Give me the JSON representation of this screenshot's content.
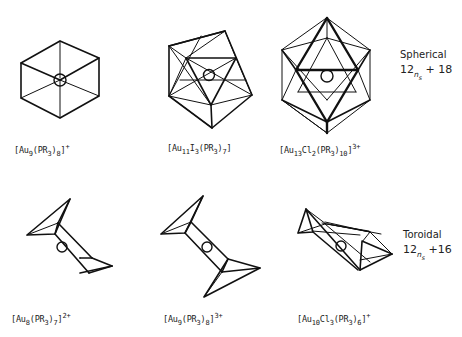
{
  "figure": {
    "rows": [
      {
        "class": "Spherical",
        "electron_rule": {
          "base": "12",
          "var": "n",
          "var_sub": "s",
          "offset": "+ 18"
        },
        "clusters": [
          {
            "id": "au9-spherical",
            "metal": "Au",
            "metal_count": "9",
            "halide": "",
            "halide_count": "",
            "ligand": "(PR",
            "ligand_sub": "3",
            "ligand_count": "8",
            "charge": "+"
          },
          {
            "id": "au11",
            "metal": "Au",
            "metal_count": "11",
            "halide": "I",
            "halide_count": "3",
            "ligand": "(PR",
            "ligand_sub": "3",
            "ligand_count": "7",
            "charge": ""
          },
          {
            "id": "au13",
            "metal": "Au",
            "metal_count": "13",
            "halide": "Cl",
            "halide_count": "2",
            "ligand": "(PR",
            "ligand_sub": "3",
            "ligand_count": "10",
            "charge": "3+"
          }
        ]
      },
      {
        "class": "Toroidal",
        "electron_rule": {
          "base": "12",
          "var": "n",
          "var_sub": "s",
          "offset": "+16"
        },
        "clusters": [
          {
            "id": "au8",
            "metal": "Au",
            "metal_count": "8",
            "halide": "",
            "halide_count": "",
            "ligand": "(PR",
            "ligand_sub": "3",
            "ligand_count": "7",
            "charge": "2+"
          },
          {
            "id": "au9-toroidal",
            "metal": "Au",
            "metal_count": "9",
            "halide": "",
            "halide_count": "",
            "ligand": "(PR",
            "ligand_sub": "3",
            "ligand_count": "8",
            "charge": "3+"
          },
          {
            "id": "au10",
            "metal": "Au",
            "metal_count": "10",
            "halide": "Cl",
            "halide_count": "3",
            "ligand": "(PR",
            "ligand_sub": "3",
            "ligand_count": "6",
            "charge": "+"
          }
        ]
      }
    ]
  }
}
